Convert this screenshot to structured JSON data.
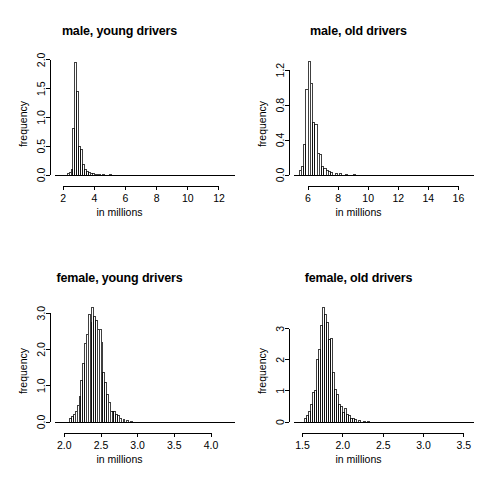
{
  "figure": {
    "layout": "2x2 grid of histograms",
    "background": "#ffffff",
    "foreground": "#000000"
  },
  "common": {
    "xlabel": "in millions",
    "ylabel": "frequency"
  },
  "chart_data": [
    {
      "type": "bar",
      "title": "male, young drivers",
      "xlabel": "in millions",
      "ylabel": "frequency",
      "xlim": [
        1.6,
        12.9
      ],
      "ylim": [
        0.0,
        2.05
      ],
      "xticks": [
        2,
        4,
        6,
        8,
        10,
        12
      ],
      "xticklabels": [
        "2",
        "4",
        "6",
        "8",
        "10",
        "12"
      ],
      "yticks": [
        0.0,
        0.5,
        1.0,
        1.5,
        2.0
      ],
      "yticklabels": [
        "0.0",
        "0.5",
        "1.0",
        "1.5",
        "2.0"
      ],
      "grid": false,
      "legend": false,
      "bin_width": 0.125,
      "bin_starts": [
        2.25,
        2.375,
        2.5,
        2.625,
        2.75,
        2.875,
        3.0,
        3.125,
        3.25,
        3.375,
        3.5,
        3.625,
        3.75,
        3.875,
        4.0,
        4.125,
        4.25,
        4.5,
        5.0
      ],
      "values": [
        0.02,
        0.04,
        0.1,
        0.8,
        1.95,
        1.45,
        0.5,
        0.45,
        0.18,
        0.1,
        0.06,
        0.04,
        0.03,
        0.02,
        0.015,
        0.01,
        0.01,
        0.005,
        0.002
      ]
    },
    {
      "type": "bar",
      "title": "male, old drivers",
      "xlabel": "in millions",
      "ylabel": "frequency",
      "xlim": [
        5.2,
        16.9
      ],
      "ylim": [
        0.0,
        1.35
      ],
      "xticks": [
        6,
        8,
        10,
        12,
        14,
        16
      ],
      "xticklabels": [
        "6",
        "8",
        "10",
        "12",
        "14",
        "16"
      ],
      "yticks": [
        0.0,
        0.4,
        0.8,
        1.2
      ],
      "yticklabels": [
        "0.0",
        "0.4",
        "0.8",
        "1.2"
      ],
      "grid": false,
      "legend": false,
      "bin_width": 0.15,
      "bin_starts": [
        5.4,
        5.55,
        5.7,
        5.85,
        6.0,
        6.15,
        6.3,
        6.45,
        6.6,
        6.75,
        6.9,
        7.05,
        7.2,
        7.35,
        7.5,
        7.8,
        8.1,
        8.5,
        9.0
      ],
      "values": [
        0.05,
        0.1,
        0.35,
        0.98,
        1.3,
        1.05,
        0.6,
        0.58,
        0.25,
        0.24,
        0.1,
        0.07,
        0.05,
        0.04,
        0.03,
        0.02,
        0.015,
        0.01,
        0.005
      ]
    },
    {
      "type": "bar",
      "title": "female, young drivers",
      "xlabel": "in millions",
      "ylabel": "frequency",
      "xlim": [
        1.9,
        4.3
      ],
      "ylim": [
        0.0,
        3.25
      ],
      "xticks": [
        2.0,
        2.5,
        3.0,
        3.5,
        4.0
      ],
      "xticklabels": [
        "2.0",
        "2.5",
        "3.0",
        "3.5",
        "4.0"
      ],
      "yticks": [
        0.0,
        1.0,
        2.0,
        3.0
      ],
      "yticklabels": [
        "0.0",
        "1.0",
        "2.0",
        "3.0"
      ],
      "grid": false,
      "legend": false,
      "bin_width": 0.025,
      "bin_starts": [
        2.075,
        2.1,
        2.125,
        2.15,
        2.175,
        2.2,
        2.225,
        2.25,
        2.275,
        2.3,
        2.325,
        2.35,
        2.375,
        2.4,
        2.425,
        2.45,
        2.475,
        2.5,
        2.525,
        2.55,
        2.575,
        2.6,
        2.625,
        2.65,
        2.675,
        2.7,
        2.725,
        2.75,
        2.8,
        2.85,
        2.9
      ],
      "values": [
        0.1,
        0.15,
        0.22,
        0.3,
        0.45,
        0.7,
        1.15,
        1.6,
        2.15,
        2.4,
        2.95,
        2.75,
        3.15,
        2.9,
        2.8,
        2.55,
        2.55,
        2.2,
        1.35,
        1.1,
        0.75,
        0.55,
        0.3,
        0.28,
        0.3,
        0.22,
        0.18,
        0.1,
        0.07,
        0.04,
        0.02
      ]
    },
    {
      "type": "bar",
      "title": "female, old drivers",
      "xlabel": "in millions",
      "ylabel": "frequency",
      "xlim": [
        1.42,
        3.6
      ],
      "ylim": [
        0,
        3.8
      ],
      "xticks": [
        1.5,
        2.0,
        2.5,
        3.0,
        3.5
      ],
      "xticklabels": [
        "1.5",
        "2.0",
        "2.5",
        "3.0",
        "3.5"
      ],
      "yticks": [
        0,
        1,
        2,
        3
      ],
      "yticklabels": [
        "0",
        "1",
        "2",
        "3"
      ],
      "grid": false,
      "legend": false,
      "bin_width": 0.025,
      "bin_starts": [
        1.525,
        1.55,
        1.575,
        1.6,
        1.625,
        1.65,
        1.675,
        1.7,
        1.725,
        1.75,
        1.775,
        1.8,
        1.825,
        1.85,
        1.875,
        1.9,
        1.925,
        1.95,
        1.975,
        2.0,
        2.025,
        2.05,
        2.075,
        2.1,
        2.125,
        2.15,
        2.2,
        2.25,
        2.3
      ],
      "values": [
        0.1,
        0.2,
        0.35,
        0.55,
        0.95,
        1.0,
        2.0,
        2.35,
        3.1,
        3.7,
        3.45,
        3.2,
        2.65,
        2.7,
        1.6,
        1.05,
        0.9,
        0.55,
        0.5,
        0.3,
        0.45,
        0.25,
        0.2,
        0.12,
        0.1,
        0.07,
        0.05,
        0.03,
        0.015
      ]
    }
  ]
}
